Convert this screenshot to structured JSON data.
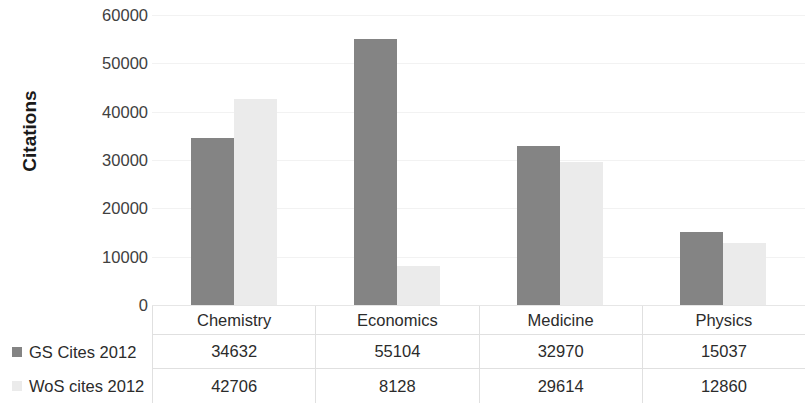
{
  "chart_data": {
    "type": "bar",
    "title": "",
    "subtitle": "",
    "xlabel": "",
    "ylabel": "Citations",
    "categories": [
      "Chemistry",
      "Economics",
      "Medicine",
      "Physics"
    ],
    "series": [
      {
        "name": "GS Cites 2012",
        "values": [
          34632,
          55104,
          32970,
          15037
        ],
        "color": "#848484"
      },
      {
        "name": "WoS cites 2012",
        "values": [
          42706,
          8128,
          29614,
          12860
        ],
        "color": "#ebebeb"
      }
    ],
    "ylim": [
      0,
      60000
    ],
    "ytick_labels": [
      "0",
      "10000",
      "20000",
      "30000",
      "40000",
      "50000",
      "60000"
    ],
    "ytick_values": [
      0,
      10000,
      20000,
      30000,
      40000,
      50000,
      60000
    ],
    "grid": true,
    "grid_axis": "y",
    "legend_position": "left-of-data-table",
    "has_data_table": true
  },
  "table": {
    "headers": [
      "Chemistry",
      "Economics",
      "Medicine",
      "Physics"
    ],
    "rows": [
      {
        "label": "GS Cites 2012",
        "values": [
          "34632",
          "55104",
          "32970",
          "15037"
        ]
      },
      {
        "label": "WoS cites 2012",
        "values": [
          "42706",
          "8128",
          "29614",
          "12860"
        ]
      }
    ]
  }
}
